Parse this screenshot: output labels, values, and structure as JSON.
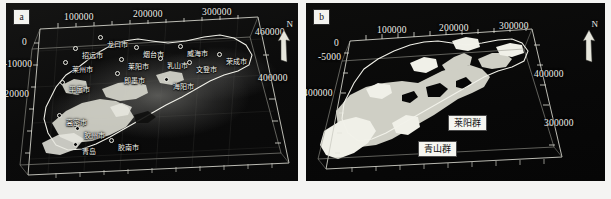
{
  "figure": {
    "background": "#f4f4f2",
    "panel_bg": "#0a0a0a"
  },
  "panels": [
    {
      "id": "a",
      "letter": "a",
      "north_label": "N",
      "axes": {
        "top": [
          "100000",
          "200000",
          "300000"
        ],
        "left": [
          "0",
          "-10000",
          "-20000"
        ],
        "right": [
          "460000",
          "400000"
        ]
      },
      "cities": [
        {
          "name": "龙口市"
        },
        {
          "name": "招远市"
        },
        {
          "name": "烟台市"
        },
        {
          "name": "威海市"
        },
        {
          "name": "莱州市"
        },
        {
          "name": "莱阳市"
        },
        {
          "name": "乳山市"
        },
        {
          "name": "文登市"
        },
        {
          "name": "荣成市"
        },
        {
          "name": "平度市"
        },
        {
          "name": "海阳市"
        },
        {
          "name": "即墨市"
        },
        {
          "name": "高密市"
        },
        {
          "name": "胶州市"
        },
        {
          "name": "青岛"
        },
        {
          "name": "胶南市"
        }
      ]
    },
    {
      "id": "b",
      "letter": "b",
      "north_label": "N",
      "axes": {
        "top": [
          "100000",
          "200000",
          "300000"
        ],
        "left": [
          "0",
          "-5000",
          "400000"
        ],
        "right": [
          "400000",
          "300000"
        ]
      },
      "units": [
        {
          "key": "laiyang",
          "label": "莱阳群",
          "color": "#d8d8cf"
        },
        {
          "key": "qingshan",
          "label": "青山群",
          "color": "#f2f2ec"
        }
      ]
    }
  ]
}
